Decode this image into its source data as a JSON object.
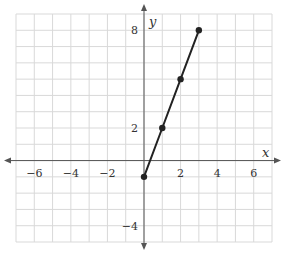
{
  "chart_data": {
    "type": "line",
    "title": "",
    "xlabel": "x",
    "ylabel": "y",
    "xlim": [
      -7,
      7
    ],
    "ylim": [
      -5,
      9
    ],
    "grid": true,
    "x_ticks": [
      -6,
      -4,
      -2,
      2,
      4,
      6
    ],
    "x_tick_labels": [
      "−6",
      "−4",
      "−2",
      "2",
      "4",
      "6"
    ],
    "y_ticks": [
      8,
      2,
      -4
    ],
    "y_tick_labels": [
      "8",
      "2",
      "−4"
    ],
    "series": [
      {
        "name": "line",
        "x": [
          0,
          1,
          2,
          3
        ],
        "y": [
          -1,
          2,
          5,
          8
        ],
        "markers": true,
        "color": "#222222"
      }
    ]
  },
  "colors": {
    "grid": "#d9d9d9",
    "axis": "#555555",
    "line": "#222222",
    "text": "#333333"
  }
}
